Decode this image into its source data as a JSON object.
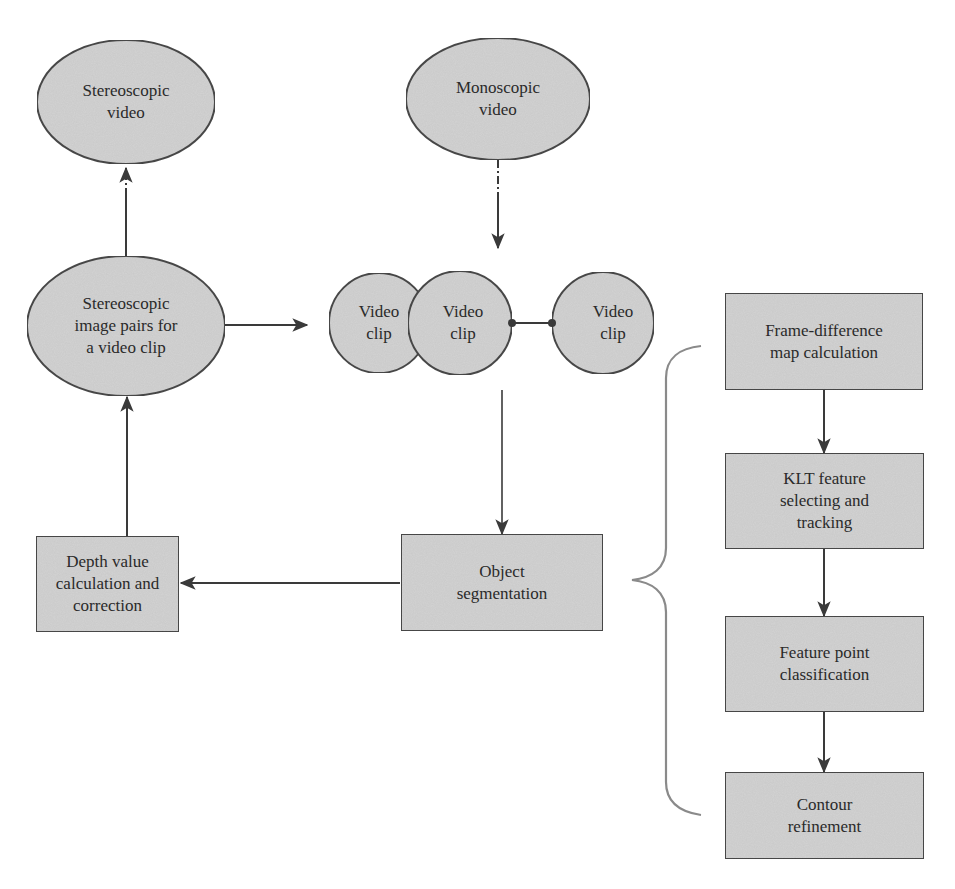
{
  "colors": {
    "node_fill": "#d3d3d3",
    "node_stroke": "#4a4a4a",
    "edge": "#3a3a3a",
    "brace": "#8a8a8a",
    "text": "#2a2a2a",
    "background": "#ffffff"
  },
  "nodes": {
    "stereoscopic_video": {
      "shape": "ellipse",
      "label": "Stereoscopic\nvideo"
    },
    "monoscopic_video": {
      "shape": "ellipse",
      "label": "Monoscopic\nvideo"
    },
    "stereo_image_pairs": {
      "shape": "ellipse",
      "label": "Stereoscopic\nimage pairs for\na video clip"
    },
    "video_clip_1": {
      "shape": "circle",
      "label": "Video\nclip"
    },
    "video_clip_2": {
      "shape": "circle",
      "label": "Video\nclip"
    },
    "video_clip_3": {
      "shape": "circle",
      "label": "Video\nclip"
    },
    "depth_value": {
      "shape": "rect",
      "label": "Depth value\ncalculation and\ncorrection"
    },
    "object_segmentation": {
      "shape": "rect",
      "label": "Object\nsegmentation"
    },
    "frame_difference": {
      "shape": "rect",
      "label": "Frame-difference\nmap calculation"
    },
    "klt_feature": {
      "shape": "rect",
      "label": "KLT feature\nselecting and\ntracking"
    },
    "feature_point": {
      "shape": "rect",
      "label": "Feature point\nclassification"
    },
    "contour_refinement": {
      "shape": "rect",
      "label": "Contour\nrefinement"
    }
  },
  "edges": [
    {
      "from": "monoscopic_video",
      "to": "video_clips",
      "style": "dash-dot"
    },
    {
      "from": "stereo_image_pairs",
      "to": "stereoscopic_video",
      "style": "dash-dot"
    },
    {
      "from": "stereo_image_pairs",
      "to": "video_clips",
      "style": "solid"
    },
    {
      "from": "video_clips",
      "to": "object_segmentation",
      "style": "solid"
    },
    {
      "from": "object_segmentation",
      "to": "depth_value",
      "style": "solid"
    },
    {
      "from": "depth_value",
      "to": "stereo_image_pairs",
      "style": "solid"
    },
    {
      "from": "frame_difference",
      "to": "klt_feature",
      "style": "solid"
    },
    {
      "from": "klt_feature",
      "to": "feature_point",
      "style": "solid"
    },
    {
      "from": "feature_point",
      "to": "contour_refinement",
      "style": "solid"
    },
    {
      "from": "video_clip_2",
      "to": "video_clip_3",
      "style": "connector"
    }
  ],
  "groups": [
    {
      "type": "brace",
      "points_to": "object_segmentation",
      "contains": [
        "frame_difference",
        "klt_feature",
        "feature_point",
        "contour_refinement"
      ]
    }
  ]
}
